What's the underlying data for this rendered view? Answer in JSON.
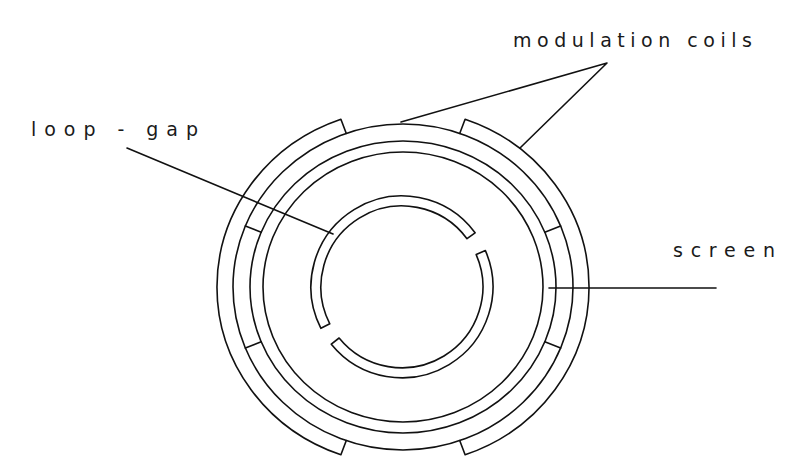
{
  "diagram": {
    "type": "cross-section schematic",
    "labels": {
      "modulation_coils": "modulation coils",
      "loop_gap": "loop - gap",
      "screen": "screen"
    },
    "colors": {
      "line": "#111111",
      "background": "#ffffff"
    },
    "components": [
      {
        "id": "modulation-coils",
        "description": "two outer arc-shaped coils (left and right) around the screen"
      },
      {
        "id": "screen",
        "description": "concentric cylindrical screen rings"
      },
      {
        "id": "loop-gap",
        "description": "inner split ring resonator with two gaps"
      }
    ]
  }
}
